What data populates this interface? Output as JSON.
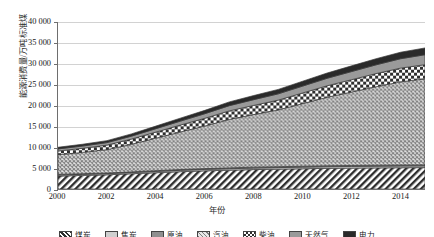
{
  "chart_data": {
    "type": "area",
    "stacked": true,
    "title": "",
    "xlabel": "年份",
    "ylabel": "能源消费量/万吨标准煤",
    "xlim": [
      2000,
      2015
    ],
    "ylim": [
      0,
      40000
    ],
    "ytick_step": 5000,
    "xtick_step": 2,
    "grid": true,
    "legend_position": "bottom",
    "x": [
      2000,
      2001,
      2002,
      2003,
      2004,
      2005,
      2006,
      2007,
      2008,
      2009,
      2010,
      2011,
      2012,
      2013,
      2014,
      2015
    ],
    "xticklabels": [
      "2000",
      "2002",
      "2004",
      "2006",
      "2008",
      "2010",
      "2012",
      "2014"
    ],
    "yticklabels": [
      "0",
      "5 000",
      "10 000",
      "15 000",
      "20 000",
      "25 000",
      "30 000",
      "35 000",
      "40 000"
    ],
    "series": [
      {
        "name": "煤炭",
        "pattern": "diagonal-hatch",
        "color": "#ffffff",
        "values": [
          3100,
          3250,
          3400,
          3650,
          3900,
          4150,
          4350,
          4500,
          4650,
          4750,
          4850,
          4950,
          5000,
          5050,
          5100,
          5120
        ]
      },
      {
        "name": "焦炭",
        "pattern": "solid-light-gray",
        "color": "#cfcfcf",
        "values": [
          250,
          260,
          270,
          285,
          300,
          320,
          335,
          350,
          360,
          370,
          380,
          390,
          400,
          405,
          410,
          415
        ]
      },
      {
        "name": "原油",
        "pattern": "solid-mid-gray",
        "color": "#8f8f8f",
        "values": [
          150,
          155,
          160,
          170,
          180,
          190,
          200,
          210,
          215,
          220,
          225,
          230,
          235,
          240,
          245,
          250
        ]
      },
      {
        "name": "汽油",
        "pattern": "cross-hatch",
        "color": "#d8d8d8",
        "values": [
          4700,
          5100,
          5600,
          6600,
          7800,
          9000,
          10200,
          11600,
          12600,
          13600,
          15000,
          16400,
          17600,
          18800,
          19900,
          20600
        ]
      },
      {
        "name": "柴油",
        "pattern": "checker-dots",
        "color": "#bdbdbd",
        "values": [
          900,
          980,
          1080,
          1250,
          1450,
          1650,
          1850,
          2050,
          2200,
          2350,
          2550,
          2750,
          2950,
          3150,
          3300,
          3400
        ]
      },
      {
        "name": "天然气",
        "pattern": "solid-gray",
        "color": "#9a9a9a",
        "values": [
          500,
          540,
          600,
          700,
          820,
          950,
          1100,
          1250,
          1380,
          1500,
          1650,
          1800,
          1950,
          2100,
          2250,
          2380
        ]
      },
      {
        "name": "电力",
        "pattern": "solid-black",
        "color": "#2a2a2a",
        "values": [
          400,
          430,
          470,
          540,
          620,
          710,
          800,
          900,
          980,
          1060,
          1160,
          1260,
          1360,
          1460,
          1550,
          1620
        ]
      }
    ],
    "totals": [
      10000,
      10715,
      11580,
      13195,
      15070,
      16970,
      18835,
      20860,
      22385,
      23850,
      25815,
      27780,
      29495,
      31205,
      32755,
      33785
    ]
  },
  "legend": {
    "items": [
      {
        "label": "煤炭"
      },
      {
        "label": "焦炭"
      },
      {
        "label": "原油"
      },
      {
        "label": "汽油"
      },
      {
        "label": "柴油"
      },
      {
        "label": "天然气"
      },
      {
        "label": "电力"
      }
    ]
  }
}
